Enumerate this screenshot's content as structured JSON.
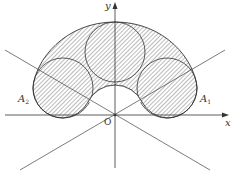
{
  "diagram": {
    "axes": {
      "x_label": "x",
      "y_label": "y",
      "origin_label": "O"
    },
    "points": [
      {
        "name": "A",
        "subscript": "1",
        "side": "right"
      },
      {
        "name": "A",
        "subscript": "2",
        "side": "left"
      }
    ],
    "shapes": {
      "circles": [
        {
          "id": "top-circle",
          "cx": 115,
          "cy": 52,
          "r": 30
        },
        {
          "id": "left-circle",
          "cx": 63,
          "cy": 88,
          "r": 30
        },
        {
          "id": "right-circle",
          "cx": 167,
          "cy": 88,
          "r": 30
        }
      ],
      "region": "annular arc region with hatch fill, inner radius 30, outer boundary through circle extremes",
      "lines": [
        "line through O at +30°",
        "line through O at -30°"
      ]
    },
    "colors": {
      "stroke": "#333333",
      "hatch": "#555555",
      "background": "#ffffff"
    }
  }
}
